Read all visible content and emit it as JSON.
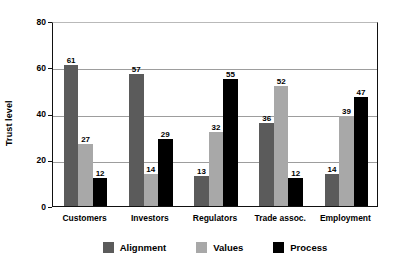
{
  "chart_data": {
    "type": "bar",
    "title": "",
    "xlabel": "",
    "ylabel": "Trust level",
    "ylim": [
      0,
      80
    ],
    "yticks": [
      0,
      20,
      40,
      60,
      80
    ],
    "grid": true,
    "legend_position": "bottom",
    "categories": [
      "Customers",
      "Investors",
      "Regulators",
      "Trade assoc.",
      "Employment"
    ],
    "series": [
      {
        "name": "Alignment",
        "color": "#5b5b5b",
        "values": [
          61,
          57,
          13,
          36,
          14
        ]
      },
      {
        "name": "Values",
        "color": "#a8a8a8",
        "values": [
          27,
          14,
          32,
          52,
          39
        ]
      },
      {
        "name": "Process",
        "color": "#000000",
        "values": [
          12,
          29,
          55,
          12,
          47
        ]
      }
    ]
  },
  "axis": {
    "y_title": "Trust level",
    "y_tick_labels": [
      "80",
      "60",
      "40",
      "20",
      "0"
    ]
  },
  "legend": {
    "items": [
      {
        "label": "Alignment"
      },
      {
        "label": "Values"
      },
      {
        "label": "Process"
      }
    ]
  }
}
